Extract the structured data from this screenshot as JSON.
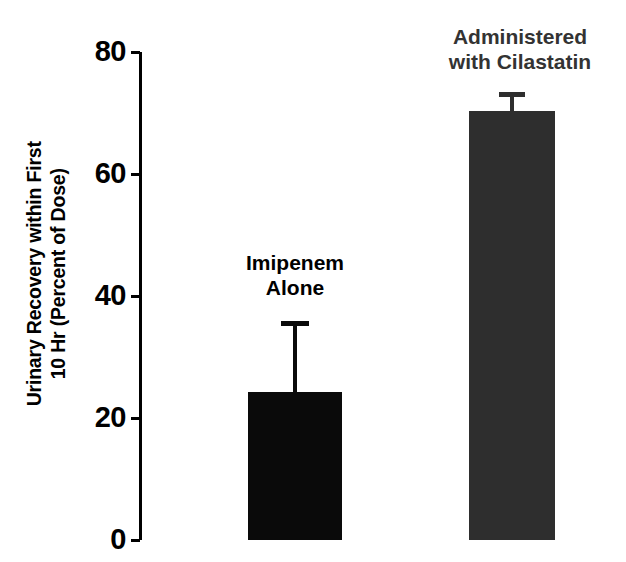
{
  "chart_data": {
    "type": "bar",
    "title": "",
    "xlabel": "",
    "ylabel": "Urinary Recovery within First 10 Hr (Percent of Dose)",
    "ylabel_lines": [
      "Urinary Recovery within First",
      "10 Hr (Percent of Dose)"
    ],
    "ylim": [
      0,
      80
    ],
    "yticks": [
      0,
      20,
      40,
      60,
      80
    ],
    "ytick_labels": [
      "0",
      "20",
      "40",
      "60",
      "80"
    ],
    "grid": false,
    "legend": "none",
    "categories": [
      "Imipenem Alone",
      "Administered with Cilastatin"
    ],
    "category_label_lines": [
      [
        "Imipenem",
        "Alone"
      ],
      [
        "Administered",
        "with Cilastatin"
      ]
    ],
    "values": [
      23.5,
      71.0
    ],
    "errors_upper": [
      11.5,
      3.0
    ],
    "error_tops": [
      35.0,
      74.0
    ],
    "bar_colors": [
      "#0a0a0a",
      "#2e2e2e"
    ],
    "label_colors": [
      "#000000",
      "#333333"
    ],
    "axis_color": "#000000",
    "background_color": "#ffffff"
  },
  "geometry": {
    "plot_top_px": 52,
    "plot_bottom_px": 540,
    "axis_x_px": 139,
    "bars": [
      {
        "left_px": 248,
        "width_px": 94,
        "top_px": 392,
        "err_cap_y_px": 321,
        "err_center_px": 295,
        "err_cap_w_px": 28
      },
      {
        "left_px": 469,
        "width_px": 86,
        "top_px": 111,
        "err_cap_y_px": 92,
        "err_center_px": 512,
        "err_cap_w_px": 26
      }
    ]
  }
}
